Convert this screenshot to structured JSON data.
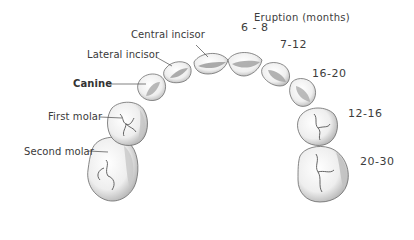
{
  "figure": {
    "type": "deciduous-dentition-eruption-diagram",
    "header": "Eruption (months)",
    "teeth": [
      {
        "name": "Central incisor",
        "eruption_months": "6 - 8"
      },
      {
        "name": "Lateral incisor",
        "eruption_months": "7-12"
      },
      {
        "name": "Canine",
        "eruption_months": "16-20"
      },
      {
        "name": "First molar",
        "eruption_months": "12-16"
      },
      {
        "name": "Second molar",
        "eruption_months": "20-30"
      }
    ]
  },
  "colors": {
    "text": "#3a3a3a",
    "tooth_fill": "#f4f4f4",
    "tooth_outline": "#6a6a6a",
    "tooth_shadow": "#bdbdbd",
    "leader_line": "#4a4a4a"
  }
}
